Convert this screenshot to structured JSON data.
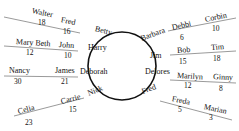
{
  "diagram": {
    "circle_names": {
      "betty": "Betty",
      "harry": "Harry",
      "deborah": "Deborah",
      "nick": "Nick",
      "barbara": "Barbara",
      "jim": "Jim",
      "delores": "Delores",
      "fred": "Fred"
    },
    "pairs": [
      {
        "a": "Walter",
        "a_num": "18",
        "b": "Fred",
        "b_num": "16"
      },
      {
        "a": "Mary Beth",
        "a_num": "12",
        "b": "John",
        "b_num": "10"
      },
      {
        "a": "Nancy",
        "a_num": "30",
        "b": "James",
        "b_num": "21"
      },
      {
        "a": "Celia",
        "a_num": "23",
        "b": "Carrie",
        "b_num": "15"
      },
      {
        "a": "Debbi",
        "a_num": "6",
        "b": "Corbin",
        "b_num": "10"
      },
      {
        "a": "Bob",
        "a_num": "15",
        "b": "Tim",
        "b_num": "18"
      },
      {
        "a": "Marilyn",
        "a_num": "12",
        "b": "Ginny",
        "b_num": "8"
      },
      {
        "a": "Freda",
        "a_num": "5",
        "b": "Marian",
        "b_num": "3"
      }
    ],
    "colors": {
      "line": "#111111",
      "background": "#ffffff"
    }
  }
}
